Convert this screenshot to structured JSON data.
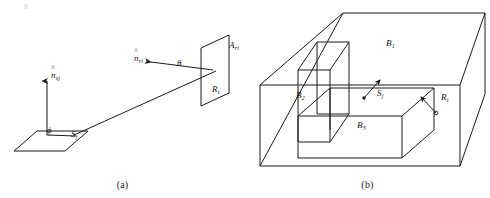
{
  "figure": {
    "title": "",
    "width": 490,
    "height": 198,
    "background": "#ffffff",
    "stroke_color": "#1a1a1a"
  },
  "panels": [
    {
      "id": "a",
      "caption": "(a)",
      "description": "Two oriented surface patches with normals and the angles between the connecting ray and each normal",
      "labels": {
        "normal_source": {
          "symbol": "n",
          "subscript": "sj",
          "hat": true,
          "x": 51,
          "y": 76
        },
        "normal_receiver": {
          "symbol": "n",
          "subscript": "ri",
          "hat": true,
          "x": 136,
          "y": 59
        },
        "angle_phi": {
          "symbol": "ϕ",
          "x": 47,
          "y": 130
        },
        "angle_theta": {
          "symbol": "θ",
          "x": 177,
          "y": 63
        },
        "source_patch": {
          "symbol": "S",
          "subscript": "j",
          "hat": false,
          "x": 72,
          "y": 134
        },
        "receiver_area": {
          "symbol": "A",
          "subscript": "ri",
          "hat": false,
          "x": 228,
          "y": 46
        },
        "receiver_patch": {
          "symbol": "R",
          "subscript": "i",
          "hat": false,
          "x": 213,
          "y": 90
        }
      }
    },
    {
      "id": "b",
      "caption": "(b)",
      "description": "Axis aligned bounding box hierarchy: outer box B1 containing inner boxes B2 and B3, with source point Sj and receiver point Ri",
      "labels": {
        "box_1": {
          "symbol": "B",
          "subscript": "1",
          "hat": false,
          "x": 386,
          "y": 44
        },
        "box_2": {
          "symbol": "B",
          "subscript": "2",
          "hat": false,
          "x": 296,
          "y": 96
        },
        "box_3": {
          "symbol": "B",
          "subscript": "3",
          "hat": false,
          "x": 357,
          "y": 126
        },
        "source_point": {
          "symbol": "S",
          "subscript": "j",
          "hat": false,
          "x": 377,
          "y": 94
        },
        "receiver_point": {
          "symbol": "R",
          "subscript": "i",
          "hat": false,
          "x": 441,
          "y": 98
        }
      }
    }
  ],
  "colors": {
    "ink": "#1a1a1a",
    "paper": "#ffffff",
    "smudge": "#d8d8d8"
  }
}
